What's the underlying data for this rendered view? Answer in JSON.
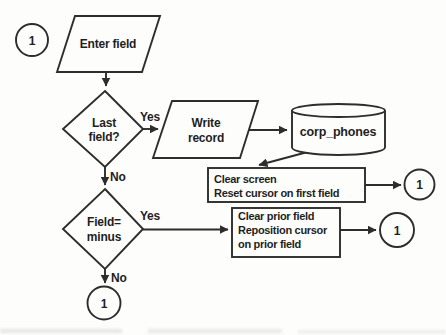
{
  "diagram": {
    "type": "flowchart",
    "nodes": {
      "start_connector": {
        "label": "1"
      },
      "enter_field": {
        "label": "Enter field"
      },
      "last_field_decision": {
        "line1": "Last",
        "line2": "field?"
      },
      "write_record": {
        "line1": "Write",
        "line2": "record"
      },
      "corp_phones_db": {
        "label": "corp_phones"
      },
      "clear_screen_process": {
        "line1": "Clear screen",
        "line2": "Reset cursor on first field"
      },
      "clear_screen_connector": {
        "label": "1"
      },
      "field_minus_decision": {
        "line1": "Field=",
        "line2": "minus"
      },
      "clear_prior_process": {
        "line1": "Clear prior field",
        "line2": "Reposition cursor",
        "line3": "on prior field"
      },
      "clear_prior_connector": {
        "label": "1"
      },
      "end_connector": {
        "label": "1"
      }
    },
    "edge_labels": {
      "last_field_yes": "Yes",
      "last_field_no": "No",
      "field_minus_yes": "Yes",
      "field_minus_no": "No"
    },
    "colors": {
      "line": "#2d2d2d",
      "text": "#1f1f1f",
      "background": "#fdfdfc"
    }
  }
}
